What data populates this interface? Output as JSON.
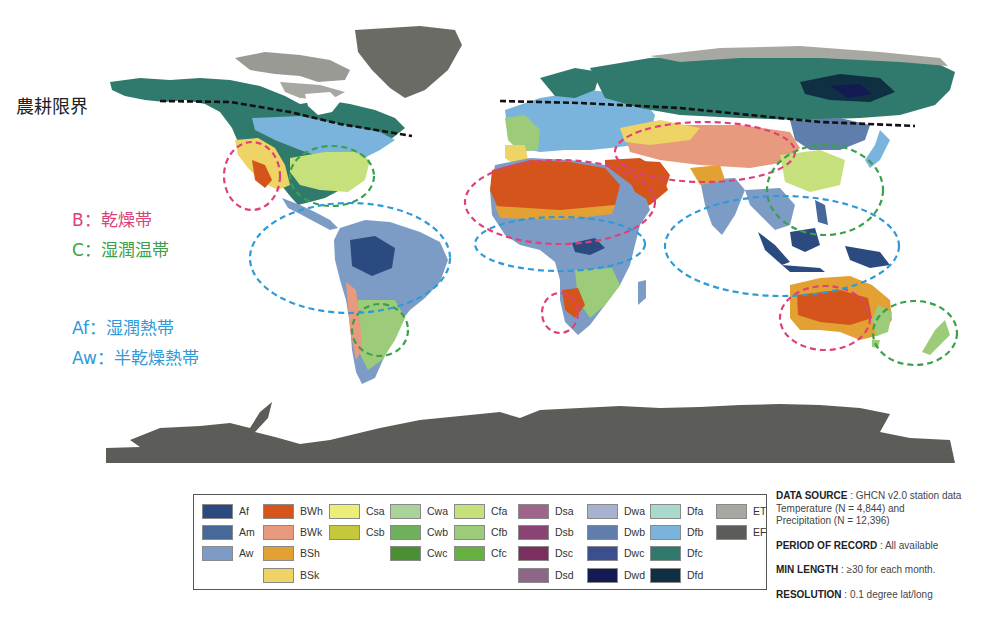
{
  "annotations": {
    "cultivation_limit": "農耕限界",
    "b_zone": "B：乾燥帯",
    "c_zone": "C：湿潤温帯",
    "af_zone": "Af：湿潤熱帯",
    "aw_zone": "Aw：半乾燥熱帯",
    "colors": {
      "b": "#e0407a",
      "c": "#3aa04a",
      "a": "#2e9ad8",
      "limit": "#111111"
    }
  },
  "legend": {
    "items": [
      {
        "code": "Af",
        "color": "#2b4a80"
      },
      {
        "code": "Am",
        "color": "#46699a"
      },
      {
        "code": "Aw",
        "color": "#7c9cc6"
      },
      {
        "code": "BWh",
        "color": "#d4541c"
      },
      {
        "code": "BWk",
        "color": "#e79a7e"
      },
      {
        "code": "BSh",
        "color": "#e3a133"
      },
      {
        "code": "BSk",
        "color": "#eed465"
      },
      {
        "code": "Csa",
        "color": "#eded7a"
      },
      {
        "code": "Csb",
        "color": "#c5c83a"
      },
      {
        "code": "Cwa",
        "color": "#a9d39b"
      },
      {
        "code": "Cwb",
        "color": "#6fb05c"
      },
      {
        "code": "Cwc",
        "color": "#4a8f32"
      },
      {
        "code": "Cfa",
        "color": "#c6e07c"
      },
      {
        "code": "Cfb",
        "color": "#9ccb79"
      },
      {
        "code": "Cfc",
        "color": "#66b140"
      },
      {
        "code": "Dsa",
        "color": "#a0648a"
      },
      {
        "code": "Dsb",
        "color": "#8a4474"
      },
      {
        "code": "Dsc",
        "color": "#7a2f5e"
      },
      {
        "code": "Dsd",
        "color": "#8e6688"
      },
      {
        "code": "Dwa",
        "color": "#a6b2d0"
      },
      {
        "code": "Dwb",
        "color": "#5f7eac"
      },
      {
        "code": "Dwc",
        "color": "#3b4e8d"
      },
      {
        "code": "Dwd",
        "color": "#141a52"
      },
      {
        "code": "Dfa",
        "color": "#a9d8cc"
      },
      {
        "code": "Dfb",
        "color": "#7ab4dc"
      },
      {
        "code": "Dfc",
        "color": "#2f7a6c"
      },
      {
        "code": "Dfd",
        "color": "#0f2f42"
      },
      {
        "code": "ET",
        "color": "#a8a8a2"
      },
      {
        "code": "EF",
        "color": "#5c5c58"
      }
    ]
  },
  "info": {
    "data_source_label": "DATA SOURCE",
    "data_source_value": " : GHCN v2.0 station data",
    "data_source_line2": "Temperature (N = 4,844) and",
    "data_source_line3": "Precipitation (N = 12,396)",
    "period_label": "PERIOD OF RECORD",
    "period_value": " : All available",
    "min_length_label": "MIN LENGTH",
    "min_length_value": " : ≥30 for each month.",
    "resolution_label": "RESOLUTION",
    "resolution_value": " : 0.1 degree lat/long"
  }
}
